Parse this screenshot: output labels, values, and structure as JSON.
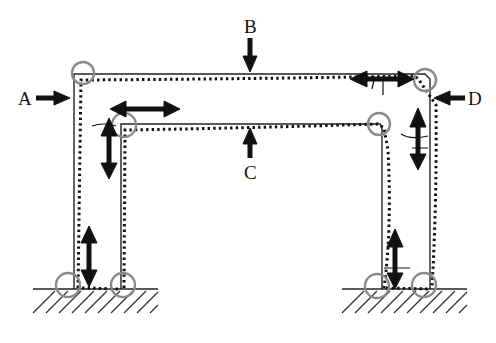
{
  "figure": {
    "type": "structural-frame-deformation-diagram",
    "labels": {
      "A": "A",
      "B": "B",
      "C": "C",
      "D": "D"
    },
    "colors": {
      "lines": "#222222",
      "joint_circles": "#8a8a8a",
      "arrows": "#111111",
      "background": "#ffffff"
    },
    "elements": {
      "outer_frame": "solid outer portal frame with dotted deformed shape",
      "inner_frame": "solid inner portal frame with dotted deformed shape",
      "joint_markers": 8,
      "double_arrows": [
        "horizontal-upper-left",
        "horizontal-upper-right",
        "vertical-left-upper",
        "vertical-right-upper",
        "vertical-left-base",
        "vertical-right-base"
      ],
      "grounds": [
        "left-hatched-ground",
        "right-hatched-ground"
      ]
    }
  }
}
